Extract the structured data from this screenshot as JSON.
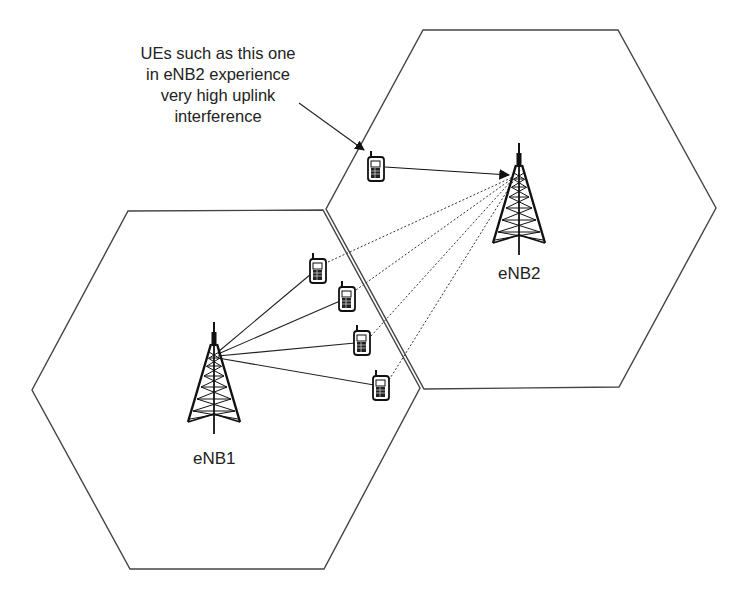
{
  "diagram": {
    "annotation": {
      "lines": [
        "UEs such as this one",
        "in eNB2 experience",
        "very high uplink",
        "interference"
      ]
    },
    "cells": [
      {
        "name": "cell-eNB1",
        "vertices": [
          [
            128,
            211
          ],
          [
            323,
            210
          ],
          [
            420,
            388
          ],
          [
            324,
            569
          ],
          [
            130,
            569
          ],
          [
            32,
            390
          ]
        ]
      },
      {
        "name": "cell-eNB2",
        "vertices": [
          [
            423,
            30
          ],
          [
            618,
            30
          ],
          [
            716,
            208
          ],
          [
            619,
            387
          ],
          [
            424,
            389
          ],
          [
            326,
            209
          ]
        ]
      }
    ],
    "base_stations": [
      {
        "label": "eNB1",
        "x": 214,
        "top": 322,
        "base": 432,
        "label_x": 192,
        "label_y": 448
      },
      {
        "label": "eNB2",
        "x": 519,
        "top": 143,
        "base": 256,
        "label_x": 497,
        "label_y": 264
      }
    ],
    "ues": [
      {
        "id": "ue-enb2",
        "x": 375,
        "y": 165,
        "cell": "eNB2"
      },
      {
        "id": "ue-1",
        "x": 318,
        "y": 268,
        "cell": "eNB1"
      },
      {
        "id": "ue-2",
        "x": 347,
        "y": 296,
        "cell": "eNB1"
      },
      {
        "id": "ue-3",
        "x": 362,
        "y": 340,
        "cell": "eNB1"
      },
      {
        "id": "ue-4",
        "x": 381,
        "y": 385,
        "cell": "eNB1"
      }
    ],
    "legend_semantics": {
      "solid_line": "serving link",
      "dotted_line": "uplink interference to eNB2"
    },
    "colors": {
      "stroke": "#222222",
      "cell_edge": "#444444",
      "background": "#ffffff"
    }
  }
}
